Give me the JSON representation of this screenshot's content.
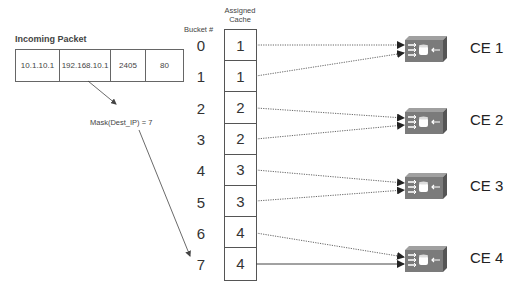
{
  "incoming_packet": {
    "title": "Incoming Packet",
    "fields": [
      "10.1.10.1",
      "192.168.10.1",
      "2405",
      "80"
    ]
  },
  "mask_label": "Mask(Dest_IP) = 7",
  "table": {
    "bucket_header": "Bucket #",
    "cache_header_line1": "Assigned",
    "cache_header_line2": "Cache",
    "rows": [
      {
        "bucket": "0",
        "cache": "1"
      },
      {
        "bucket": "1",
        "cache": "1"
      },
      {
        "bucket": "2",
        "cache": "2"
      },
      {
        "bucket": "3",
        "cache": "2"
      },
      {
        "bucket": "4",
        "cache": "3"
      },
      {
        "bucket": "5",
        "cache": "3"
      },
      {
        "bucket": "6",
        "cache": "4"
      },
      {
        "bucket": "7",
        "cache": "4"
      }
    ]
  },
  "content_engines": [
    {
      "label": "CE 1"
    },
    {
      "label": "CE 2"
    },
    {
      "label": "CE 3"
    },
    {
      "label": "CE 4"
    }
  ],
  "colors": {
    "device_fill": "#7a7a7a",
    "line": "#555555"
  }
}
